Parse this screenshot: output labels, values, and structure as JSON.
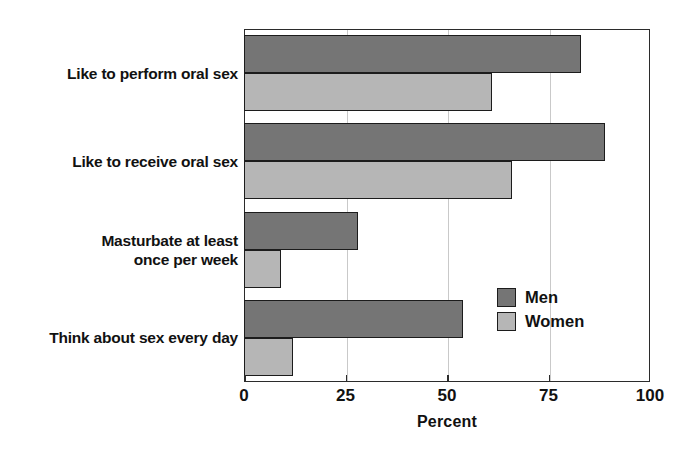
{
  "chart_data": {
    "type": "bar",
    "orientation": "horizontal",
    "title": "",
    "subtitle": "",
    "xlabel": "Percent",
    "ylabel": "",
    "xlim": [
      0,
      100
    ],
    "xticks": [
      0,
      25,
      50,
      75,
      100
    ],
    "xtick_labels": [
      "0",
      "25",
      "50",
      "75",
      "100"
    ],
    "grid": true,
    "grid_axis": "x",
    "legend_position": "inside-right",
    "categories": [
      "Like to perform oral sex",
      "Like to receive oral sex",
      "Masturbate at least once per week",
      "Think about sex every day"
    ],
    "category_lines": [
      [
        "Like to perform oral sex"
      ],
      [
        "Like to receive oral sex"
      ],
      [
        "Masturbate at least",
        "once per week"
      ],
      [
        "Think about sex every day"
      ]
    ],
    "series": [
      {
        "name": "Men",
        "color": "#757575",
        "values": [
          83,
          89,
          28,
          54
        ]
      },
      {
        "name": "Women",
        "color": "#b6b6b6",
        "values": [
          61,
          66,
          9,
          12
        ]
      }
    ]
  },
  "legend": {
    "items": [
      {
        "label": "Men",
        "color": "#757575"
      },
      {
        "label": "Women",
        "color": "#b6b6b6"
      }
    ]
  },
  "axis": {
    "x_title": "Percent",
    "tick_labels": [
      "0",
      "25",
      "50",
      "75",
      "100"
    ]
  },
  "colors": {
    "men": "#757575",
    "women": "#b6b6b6",
    "outline": "#1c1c1c",
    "frame": "#2b2b2b",
    "gridline": "#c9c9c9",
    "background": "#ffffff",
    "text": "#111111"
  }
}
